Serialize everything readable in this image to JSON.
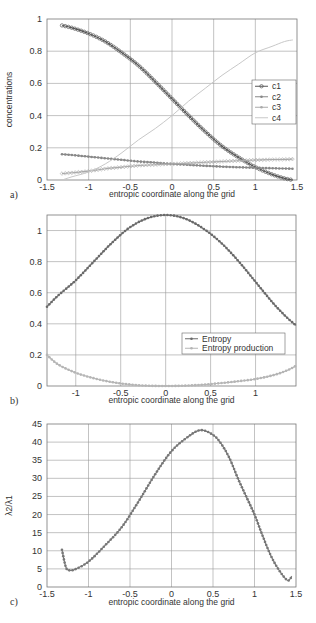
{
  "chart_data": [
    {
      "id": "a",
      "type": "line",
      "panel_label": "a)",
      "title": "",
      "xlabel": "entropic coordinate along the grid",
      "ylabel": "concentrations",
      "xlim": [
        -1.5,
        1.5
      ],
      "ylim": [
        0,
        1
      ],
      "xticks": [
        -1.5,
        -1,
        -0.5,
        0,
        0.5,
        1,
        1.5
      ],
      "xtick_labels": [
        "-1.5",
        "-1",
        "-0.5",
        "0",
        "0.5",
        "1",
        "1.5"
      ],
      "yticks": [
        0,
        0.2,
        0.4,
        0.6,
        0.8,
        1
      ],
      "ytick_labels": [
        "0",
        "0.2",
        "0.4",
        "0.6",
        "0.8",
        "1"
      ],
      "grid": true,
      "legend_position": "center right",
      "x": [
        -1.32,
        -1.2,
        -1.0,
        -0.8,
        -0.6,
        -0.4,
        -0.2,
        0.0,
        0.2,
        0.4,
        0.6,
        0.8,
        1.0,
        1.2,
        1.35,
        1.45
      ],
      "series": [
        {
          "name": "c1",
          "color": "#555555",
          "marker": "circle",
          "values": [
            0.96,
            0.945,
            0.91,
            0.86,
            0.79,
            0.71,
            0.61,
            0.505,
            0.4,
            0.3,
            0.21,
            0.14,
            0.08,
            0.035,
            0.01,
            0.0
          ]
        },
        {
          "name": "c2",
          "color": "#888888",
          "marker": "star",
          "values": [
            0.16,
            0.155,
            0.145,
            0.135,
            0.125,
            0.115,
            0.108,
            0.1,
            0.094,
            0.088,
            0.083,
            0.079,
            0.076,
            0.073,
            0.071,
            0.07
          ]
        },
        {
          "name": "c3",
          "color": "#aaaaaa",
          "marker": "diamond",
          "values": [
            0.04,
            0.045,
            0.055,
            0.07,
            0.08,
            0.09,
            0.095,
            0.1,
            0.105,
            0.11,
            0.115,
            0.12,
            0.124,
            0.127,
            0.128,
            0.13
          ]
        },
        {
          "name": "c4",
          "color": "#c8c8c8",
          "marker": "none",
          "values": [
            0.0,
            0.02,
            0.05,
            0.1,
            0.17,
            0.25,
            0.32,
            0.4,
            0.49,
            0.57,
            0.65,
            0.72,
            0.79,
            0.83,
            0.86,
            0.87
          ]
        }
      ]
    },
    {
      "id": "b",
      "type": "line",
      "panel_label": "b)",
      "title": "",
      "xlabel": "entropic coordinate along the grid",
      "ylabel": "",
      "xlim": [
        -1.32,
        1.45
      ],
      "ylim": [
        0,
        1.1
      ],
      "xticks": [
        -1,
        -0.5,
        0,
        0.5,
        1
      ],
      "xtick_labels": [
        "-1",
        "-0.5",
        "0",
        "0.5",
        "1"
      ],
      "yticks": [
        0,
        0.2,
        0.4,
        0.6,
        0.8,
        1
      ],
      "ytick_labels": [
        "0",
        "0.2",
        "0.4",
        "0.6",
        "0.8",
        "1"
      ],
      "grid": true,
      "legend_position": "lower right",
      "x": [
        -1.32,
        -1.2,
        -1.0,
        -0.8,
        -0.6,
        -0.4,
        -0.2,
        0.0,
        0.2,
        0.4,
        0.6,
        0.8,
        1.0,
        1.2,
        1.35,
        1.45
      ],
      "series": [
        {
          "name": "Entropy",
          "color": "#6a6a6a",
          "marker": "dot",
          "values": [
            0.51,
            0.58,
            0.68,
            0.8,
            0.92,
            1.02,
            1.08,
            1.1,
            1.08,
            1.02,
            0.93,
            0.81,
            0.67,
            0.53,
            0.44,
            0.39
          ]
        },
        {
          "name": "Entropy production",
          "color": "#b5b5b5",
          "marker": "dot",
          "values": [
            0.2,
            0.14,
            0.085,
            0.05,
            0.025,
            0.01,
            0.002,
            0.0,
            0.002,
            0.008,
            0.018,
            0.03,
            0.045,
            0.07,
            0.1,
            0.13
          ]
        }
      ]
    },
    {
      "id": "c",
      "type": "line",
      "panel_label": "c)",
      "title": "",
      "xlabel": "entropic coordinate along the grid",
      "ylabel": "λ2/λ1",
      "xlim": [
        -1.5,
        1.5
      ],
      "ylim": [
        0,
        45
      ],
      "xticks": [
        -1.5,
        -1,
        -0.5,
        0,
        0.5,
        1,
        1.5
      ],
      "xtick_labels": [
        "-1.5",
        "-1",
        "-0.5",
        "0",
        "0.5",
        "1",
        "1.5"
      ],
      "yticks": [
        0,
        5,
        10,
        15,
        20,
        25,
        30,
        35,
        40,
        45
      ],
      "ytick_labels": [
        "0",
        "5",
        "10",
        "15",
        "20",
        "25",
        "30",
        "35",
        "40",
        "45"
      ],
      "grid": true,
      "x": [
        -1.32,
        -1.27,
        -1.22,
        -1.15,
        -1.0,
        -0.8,
        -0.6,
        -0.4,
        -0.2,
        0.0,
        0.2,
        0.35,
        0.5,
        0.6,
        0.7,
        0.8,
        0.9,
        1.0,
        1.1,
        1.2,
        1.3,
        1.4,
        1.45
      ],
      "series": [
        {
          "name": "λ2/λ1",
          "color": "#777777",
          "marker": "dot",
          "values": [
            10.3,
            5.3,
            4.6,
            5.0,
            7.0,
            11.5,
            16.5,
            23.5,
            31.0,
            37.5,
            41.5,
            43.3,
            42.0,
            39.5,
            35.5,
            30.0,
            25.0,
            20.0,
            14.0,
            8.5,
            4.5,
            1.8,
            3.0
          ]
        }
      ]
    }
  ]
}
